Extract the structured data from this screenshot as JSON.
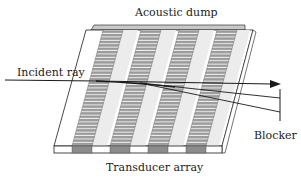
{
  "labels": {
    "acoustic_dump": "Acoustic dump",
    "incident_ray": "Incident ray",
    "blocker": "Blocker",
    "transducer_array": "Transducer array"
  },
  "colors": {
    "line": "#1a1a1a",
    "plate": "#ffffff",
    "band_light": "#ececec",
    "stripe": "#9a9a9a",
    "stripe_line": "#f2f2f2",
    "transducer": "#8c8c8c",
    "dump": "#c8c8c8"
  },
  "geometry": {
    "stripe_count": 4
  }
}
